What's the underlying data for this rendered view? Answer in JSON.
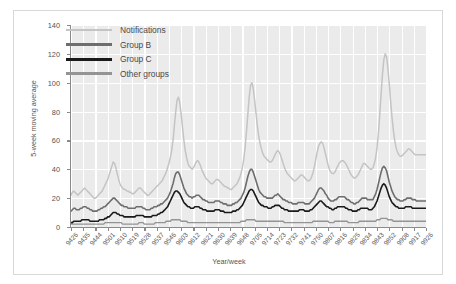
{
  "chart": {
    "type": "line",
    "ylabel": "5-week moving average",
    "xlabel": "Year/week"
  },
  "legend": {
    "position": "top-left-inside",
    "items": [
      {
        "label": "Notifications",
        "color": "#c4c4c4",
        "width": 2.2
      },
      {
        "label": "Group B",
        "color": "#6e6e6e",
        "width": 2.8
      },
      {
        "label": "Group C",
        "color": "#1a1a1a",
        "width": 2.8
      },
      {
        "label": "Other groups",
        "color": "#949494",
        "width": 2.6
      }
    ]
  },
  "yaxis": {
    "ticks": [
      "0",
      "20",
      "40",
      "60",
      "80",
      "100",
      "120",
      "140"
    ],
    "min": 0,
    "max": 140,
    "step": 20
  },
  "xaxis": {
    "ticks": [
      "9426",
      "9435",
      "9444",
      "9501",
      "9510",
      "9519",
      "9528",
      "9537",
      "9546",
      "9603",
      "9612",
      "9621",
      "9630",
      "9639",
      "9648",
      "9705",
      "9714",
      "9723",
      "9732",
      "9741",
      "9750",
      "9807",
      "9816",
      "9825",
      "9834",
      "9843",
      "9852",
      "9908",
      "9917",
      "9926"
    ]
  },
  "chart_data": {
    "type": "line",
    "title": "",
    "xlabel": "Year/week",
    "ylabel": "5-week moving average",
    "ylim": [
      0,
      140
    ],
    "grid": true,
    "legend_position": "upper left",
    "x_tick_labels": [
      "9426",
      "9435",
      "9444",
      "9501",
      "9510",
      "9519",
      "9528",
      "9537",
      "9546",
      "9603",
      "9612",
      "9621",
      "9630",
      "9639",
      "9648",
      "9705",
      "9714",
      "9723",
      "9732",
      "9741",
      "9750",
      "9807",
      "9816",
      "9825",
      "9834",
      "9843",
      "9852",
      "9908",
      "9917",
      "9926"
    ],
    "x_index_range": [
      0,
      261
    ],
    "series": [
      {
        "name": "Notifications",
        "color": "#c4c4c4",
        "values": [
          22,
          24,
          25,
          24,
          23,
          22,
          23,
          24,
          25,
          26,
          27,
          26,
          25,
          24,
          23,
          22,
          21,
          20,
          20,
          21,
          22,
          23,
          24,
          25,
          27,
          29,
          31,
          33,
          36,
          39,
          42,
          45,
          44,
          41,
          37,
          33,
          30,
          28,
          27,
          26,
          26,
          25,
          25,
          24,
          24,
          23,
          23,
          24,
          25,
          26,
          27,
          27,
          26,
          25,
          24,
          23,
          22,
          22,
          23,
          24,
          25,
          26,
          27,
          28,
          29,
          30,
          31,
          32,
          34,
          36,
          38,
          41,
          44,
          48,
          53,
          60,
          70,
          80,
          88,
          90,
          86,
          78,
          69,
          60,
          53,
          48,
          44,
          42,
          41,
          40,
          41,
          43,
          45,
          46,
          45,
          43,
          40,
          38,
          36,
          34,
          33,
          32,
          31,
          30,
          30,
          31,
          32,
          33,
          33,
          32,
          31,
          30,
          29,
          28,
          28,
          27,
          27,
          26,
          26,
          27,
          28,
          29,
          30,
          32,
          34,
          37,
          41,
          47,
          55,
          66,
          78,
          90,
          98,
          100,
          96,
          88,
          79,
          70,
          63,
          58,
          54,
          51,
          49,
          48,
          47,
          46,
          45,
          45,
          46,
          48,
          50,
          52,
          53,
          52,
          50,
          47,
          44,
          41,
          39,
          37,
          36,
          35,
          34,
          33,
          32,
          32,
          33,
          34,
          35,
          36,
          36,
          35,
          34,
          33,
          32,
          32,
          33,
          35,
          38,
          42,
          47,
          52,
          56,
          58,
          59,
          58,
          55,
          51,
          47,
          43,
          40,
          38,
          37,
          37,
          38,
          40,
          42,
          44,
          45,
          46,
          46,
          45,
          44,
          42,
          40,
          38,
          36,
          35,
          34,
          34,
          35,
          36,
          38,
          40,
          42,
          44,
          44,
          43,
          42,
          41,
          40,
          40,
          41,
          44,
          48,
          55,
          65,
          78,
          92,
          106,
          116,
          120,
          118,
          110,
          99,
          87,
          76,
          67,
          60,
          55,
          52,
          50,
          49,
          49,
          50,
          51,
          52,
          53,
          54,
          54,
          53,
          52,
          51,
          50,
          50,
          50,
          50,
          50,
          50,
          50,
          50,
          50
        ]
      },
      {
        "name": "Group B",
        "color": "#6e6e6e",
        "values": [
          11,
          12,
          13,
          13,
          12,
          12,
          12,
          13,
          13,
          14,
          14,
          14,
          13,
          13,
          12,
          12,
          11,
          11,
          11,
          11,
          12,
          12,
          13,
          13,
          14,
          14,
          15,
          16,
          17,
          18,
          19,
          20,
          20,
          19,
          18,
          17,
          16,
          15,
          15,
          14,
          14,
          14,
          13,
          13,
          13,
          13,
          13,
          13,
          14,
          14,
          14,
          14,
          14,
          13,
          13,
          12,
          12,
          12,
          12,
          13,
          13,
          14,
          14,
          14,
          15,
          15,
          16,
          16,
          17,
          18,
          19,
          20,
          22,
          24,
          27,
          30,
          34,
          37,
          38,
          38,
          36,
          33,
          30,
          27,
          25,
          23,
          22,
          21,
          21,
          20,
          21,
          21,
          22,
          22,
          22,
          21,
          20,
          19,
          19,
          18,
          18,
          17,
          17,
          17,
          17,
          17,
          18,
          18,
          18,
          18,
          17,
          17,
          16,
          16,
          16,
          15,
          15,
          15,
          15,
          16,
          16,
          17,
          17,
          18,
          19,
          20,
          22,
          24,
          27,
          31,
          35,
          38,
          40,
          40,
          38,
          35,
          32,
          29,
          26,
          24,
          23,
          22,
          21,
          21,
          20,
          20,
          20,
          20,
          20,
          21,
          22,
          22,
          23,
          22,
          21,
          20,
          19,
          19,
          18,
          18,
          17,
          17,
          17,
          16,
          16,
          16,
          16,
          17,
          17,
          17,
          17,
          17,
          16,
          16,
          16,
          16,
          17,
          18,
          19,
          20,
          22,
          24,
          26,
          27,
          27,
          26,
          25,
          23,
          22,
          20,
          19,
          18,
          18,
          18,
          19,
          19,
          20,
          21,
          21,
          21,
          21,
          21,
          20,
          19,
          19,
          18,
          17,
          17,
          16,
          16,
          17,
          17,
          18,
          19,
          20,
          20,
          20,
          20,
          19,
          19,
          19,
          19,
          19,
          21,
          23,
          26,
          30,
          34,
          38,
          41,
          42,
          41,
          39,
          35,
          31,
          28,
          25,
          23,
          21,
          20,
          19,
          19,
          18,
          18,
          18,
          19,
          19,
          20,
          20,
          20,
          20,
          19,
          19,
          19,
          18,
          18,
          18,
          18,
          18,
          18,
          18,
          18
        ]
      },
      {
        "name": "Group C",
        "color": "#1a1a1a",
        "values": [
          3,
          3,
          4,
          4,
          4,
          4,
          4,
          4,
          5,
          5,
          5,
          5,
          5,
          5,
          4,
          4,
          4,
          4,
          4,
          4,
          4,
          5,
          5,
          5,
          5,
          6,
          6,
          7,
          7,
          8,
          9,
          10,
          10,
          10,
          9,
          9,
          8,
          8,
          8,
          7,
          7,
          7,
          7,
          7,
          7,
          7,
          7,
          7,
          8,
          8,
          8,
          8,
          8,
          8,
          7,
          7,
          7,
          7,
          7,
          7,
          8,
          8,
          8,
          8,
          9,
          9,
          10,
          10,
          11,
          12,
          13,
          14,
          16,
          18,
          20,
          22,
          24,
          25,
          25,
          24,
          23,
          21,
          19,
          17,
          16,
          15,
          14,
          14,
          13,
          13,
          13,
          14,
          14,
          14,
          14,
          13,
          13,
          12,
          12,
          12,
          11,
          11,
          11,
          11,
          11,
          11,
          12,
          12,
          12,
          12,
          11,
          11,
          11,
          10,
          10,
          10,
          10,
          10,
          10,
          11,
          11,
          11,
          12,
          12,
          13,
          14,
          15,
          17,
          19,
          21,
          23,
          25,
          26,
          26,
          25,
          23,
          21,
          19,
          17,
          16,
          15,
          15,
          14,
          14,
          14,
          13,
          13,
          13,
          14,
          14,
          15,
          15,
          15,
          15,
          14,
          13,
          13,
          12,
          12,
          12,
          11,
          11,
          11,
          11,
          11,
          11,
          11,
          11,
          12,
          12,
          12,
          12,
          11,
          11,
          11,
          11,
          12,
          12,
          13,
          14,
          15,
          16,
          17,
          18,
          18,
          17,
          16,
          15,
          14,
          14,
          13,
          13,
          12,
          12,
          13,
          13,
          14,
          14,
          14,
          14,
          14,
          14,
          13,
          13,
          12,
          12,
          12,
          11,
          11,
          11,
          11,
          12,
          12,
          13,
          13,
          13,
          13,
          13,
          13,
          12,
          12,
          12,
          13,
          14,
          16,
          18,
          21,
          24,
          27,
          29,
          30,
          29,
          27,
          24,
          21,
          19,
          17,
          16,
          15,
          14,
          14,
          13,
          13,
          13,
          13,
          13,
          14,
          14,
          14,
          14,
          14,
          13,
          13,
          13,
          13,
          13,
          13,
          13,
          13,
          13,
          13,
          13
        ]
      },
      {
        "name": "Other groups",
        "color": "#949494",
        "values": [
          2,
          2,
          2,
          2,
          2,
          2,
          2,
          2,
          2,
          2,
          2,
          2,
          2,
          2,
          2,
          2,
          2,
          2,
          2,
          2,
          2,
          2,
          2,
          2,
          2,
          3,
          3,
          3,
          3,
          3,
          3,
          3,
          3,
          3,
          3,
          3,
          3,
          3,
          2,
          2,
          2,
          2,
          2,
          2,
          2,
          2,
          2,
          2,
          2,
          2,
          3,
          3,
          3,
          3,
          2,
          2,
          2,
          2,
          2,
          2,
          2,
          2,
          3,
          3,
          3,
          3,
          3,
          3,
          3,
          3,
          4,
          4,
          4,
          4,
          5,
          5,
          5,
          5,
          5,
          5,
          5,
          4,
          4,
          4,
          4,
          4,
          3,
          3,
          3,
          3,
          3,
          3,
          3,
          3,
          3,
          3,
          3,
          3,
          3,
          3,
          3,
          3,
          3,
          3,
          3,
          3,
          3,
          3,
          3,
          3,
          3,
          3,
          3,
          3,
          3,
          3,
          3,
          3,
          3,
          3,
          3,
          3,
          3,
          3,
          3,
          4,
          4,
          4,
          4,
          5,
          5,
          5,
          5,
          5,
          5,
          5,
          4,
          4,
          4,
          4,
          4,
          4,
          4,
          4,
          4,
          4,
          4,
          4,
          4,
          4,
          4,
          4,
          4,
          4,
          4,
          4,
          4,
          3,
          3,
          3,
          3,
          3,
          3,
          3,
          3,
          3,
          3,
          3,
          3,
          3,
          3,
          3,
          3,
          3,
          3,
          3,
          3,
          3,
          4,
          4,
          4,
          4,
          4,
          4,
          4,
          4,
          4,
          4,
          4,
          4,
          3,
          3,
          3,
          3,
          4,
          4,
          4,
          4,
          4,
          4,
          4,
          4,
          4,
          4,
          3,
          3,
          3,
          3,
          3,
          3,
          3,
          3,
          4,
          4,
          4,
          4,
          4,
          4,
          4,
          4,
          4,
          4,
          4,
          4,
          4,
          5,
          5,
          5,
          6,
          6,
          6,
          6,
          6,
          5,
          5,
          5,
          5,
          4,
          4,
          4,
          4,
          4,
          4,
          4,
          4,
          4,
          4,
          4,
          4,
          4,
          4,
          4,
          4,
          4,
          4,
          4,
          4,
          4,
          4,
          4,
          4,
          4
        ]
      }
    ]
  }
}
